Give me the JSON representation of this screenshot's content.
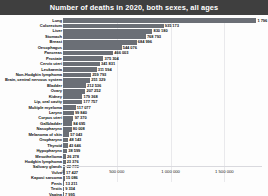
{
  "header": {
    "title": "Number of deaths in 2020, both sexes, all ages"
  },
  "axis": {
    "ticks": [
      "0",
      "500 000",
      "1 000 000",
      "1 500 000"
    ],
    "tick_values": [
      0,
      500000,
      1000000,
      1500000
    ],
    "max": 1850000
  },
  "colors": {
    "title_bar": "#3f3f3f",
    "title_text": "#ffffff",
    "bar": "#6b6f76",
    "grid": "#e9e9ec",
    "background": "#fdfdfd"
  },
  "chart_data": {
    "type": "bar",
    "orientation": "horizontal",
    "title": "Number of deaths in 2020, both sexes, all ages",
    "xlabel": "",
    "ylabel": "",
    "xlim": [
      0,
      1850000
    ],
    "grid": true,
    "legend": false,
    "categories": [
      "Lung",
      "Colorectum",
      "Liver",
      "Stomach",
      "Breast",
      "Oesophagus",
      "Pancreas",
      "Prostate",
      "Cervix uteri",
      "Leukaemia",
      "Non-Hodgkin lymphoma",
      "Brain, central nervous system",
      "Bladder",
      "Ovary",
      "Kidney",
      "Lip, oral cavity",
      "Multiple myeloma",
      "Larynx",
      "Corpus uteri",
      "Gallbladder",
      "Nasopharynx",
      "Melanoma of skin",
      "Oropharynx",
      "Thyroid",
      "Hypopharynx",
      "Mesothelioma",
      "Hodgkin lymphoma",
      "Salivary glands",
      "Vulva",
      "Kaposi sarcoma",
      "Penis",
      "Testis",
      "Vagina"
    ],
    "values": [
      1796144,
      935173,
      830180,
      768793,
      684996,
      544076,
      466003,
      375304,
      341831,
      311594,
      259793,
      251329,
      212536,
      207252,
      179368,
      177757,
      117077,
      99840,
      97370,
      84695,
      80008,
      57043,
      48143,
      43646,
      38599,
      26278,
      23376,
      22778,
      17427,
      15086,
      13211,
      9334,
      7995
    ],
    "value_labels": [
      "1 796 144",
      "935 173",
      "830 180",
      "768 793",
      "684 996",
      "544 076",
      "466 003",
      "375 304",
      "341 831",
      "311 594",
      "259 793",
      "251 329",
      "212 536",
      "207 252",
      "179 368",
      "177 757",
      "117 077",
      "99 840",
      "97 370",
      "84 695",
      "80 008",
      "57 043",
      "48 143",
      "43 646",
      "38 599",
      "26 278",
      "23 376",
      "22 778",
      "17 427",
      "15 086",
      "13 211",
      "9 334",
      "7 995"
    ]
  }
}
